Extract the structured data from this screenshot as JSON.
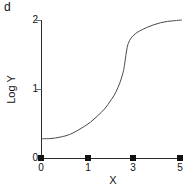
{
  "panel": {
    "label": "d"
  },
  "chart_data": {
    "type": "line",
    "title": "",
    "subtitle": "",
    "xlabel": "X",
    "ylabel": "Log Y",
    "xlim": [
      0,
      5
    ],
    "ylim": [
      0,
      2
    ],
    "grid": false,
    "legend": null,
    "xticks": [
      0,
      1,
      3,
      5
    ],
    "xtick_labels": [
      "0",
      "1",
      "3",
      "5"
    ],
    "yticks": [
      0,
      1,
      2
    ],
    "ytick_labels": [
      "0",
      "1",
      "2"
    ],
    "markers": {
      "shape": "square",
      "color": "#111111",
      "x": [
        0,
        1,
        3,
        5
      ],
      "y": [
        0,
        0,
        0,
        0
      ]
    },
    "series": [
      {
        "name": "Log Y vs X",
        "color": "#4a4a4a",
        "x": [
          0.0,
          0.25,
          0.5,
          0.75,
          1.0,
          1.25,
          1.5,
          1.75,
          2.0,
          2.25,
          2.5,
          2.65,
          2.8,
          2.9,
          2.95,
          3.0,
          3.05,
          3.1,
          3.2,
          3.35,
          3.5,
          3.75,
          4.0,
          4.25,
          4.5,
          4.75,
          5.0
        ],
        "y": [
          0.28,
          0.28,
          0.29,
          0.31,
          0.34,
          0.39,
          0.45,
          0.52,
          0.61,
          0.71,
          0.85,
          0.95,
          1.09,
          1.22,
          1.31,
          1.45,
          1.58,
          1.66,
          1.74,
          1.8,
          1.84,
          1.89,
          1.93,
          1.96,
          1.98,
          1.99,
          2.0
        ]
      }
    ]
  },
  "axis": {
    "line_color": "#2b2b2b"
  }
}
